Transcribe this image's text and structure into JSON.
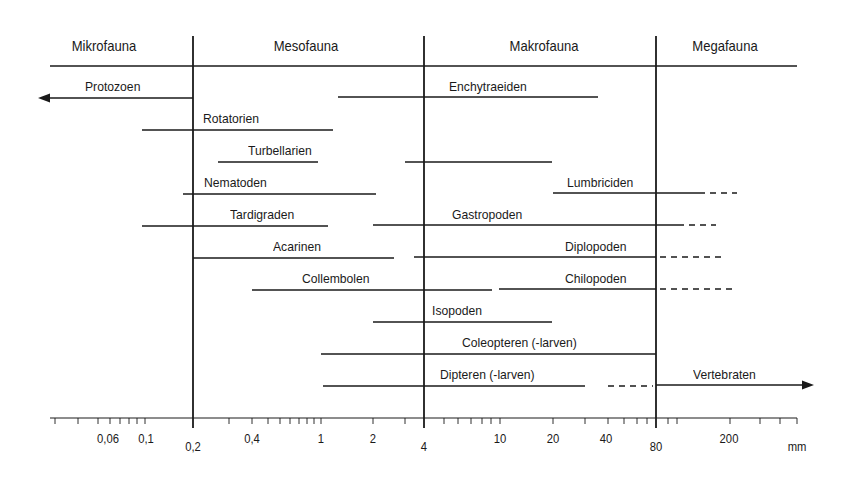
{
  "colors": {
    "line": "#1a1a1a",
    "background": "#ffffff"
  },
  "headers": [
    {
      "label": "Mikrofauna",
      "x_center": 104
    },
    {
      "label": "Mesofauna",
      "x_center": 306
    },
    {
      "label": "Makrofauna",
      "x_center": 544
    },
    {
      "label": "Megafauna",
      "x_center": 725
    }
  ],
  "groups": [
    {
      "label": "Protozoen",
      "label_x": 85,
      "label_y": 79,
      "y": 98,
      "segments": [
        {
          "x1": 50,
          "x2": 193,
          "style": "solid"
        }
      ],
      "arrow_left": true
    },
    {
      "label": "Enchytraeiden",
      "label_x": 449,
      "label_y": 79,
      "y": 97,
      "segments": [
        {
          "x1": 338,
          "x2": 598,
          "style": "solid"
        }
      ]
    },
    {
      "label": "Rotatorien",
      "label_x": 203,
      "label_y": 111,
      "y": 130,
      "segments": [
        {
          "x1": 142,
          "x2": 333,
          "style": "solid"
        }
      ]
    },
    {
      "label": "Turbellarien",
      "label_x": 248,
      "label_y": 143,
      "y": 162,
      "segments": [
        {
          "x1": 218,
          "x2": 318,
          "style": "solid"
        },
        {
          "x1": 405,
          "x2": 552,
          "style": "solid"
        }
      ]
    },
    {
      "label": "Nematoden",
      "label_x": 204,
      "label_y": 175,
      "y": 194,
      "segments": [
        {
          "x1": 183,
          "x2": 376,
          "style": "solid"
        }
      ]
    },
    {
      "label": "Lumbriciden",
      "label_x": 567,
      "label_y": 175,
      "y": 193,
      "segments": [
        {
          "x1": 553,
          "x2": 705,
          "style": "solid"
        },
        {
          "x1": 710,
          "x2": 737,
          "style": "dashed"
        }
      ]
    },
    {
      "label": "Tardigraden",
      "label_x": 230,
      "label_y": 207,
      "y": 226,
      "segments": [
        {
          "x1": 142,
          "x2": 328,
          "style": "solid"
        }
      ]
    },
    {
      "label": "Gastropoden",
      "label_x": 452,
      "label_y": 207,
      "y": 225,
      "segments": [
        {
          "x1": 373,
          "x2": 684,
          "style": "solid"
        },
        {
          "x1": 689,
          "x2": 716,
          "style": "dashed"
        }
      ]
    },
    {
      "label": "Acarinen",
      "label_x": 273,
      "label_y": 239,
      "y": 258,
      "segments": [
        {
          "x1": 193,
          "x2": 394,
          "style": "solid"
        }
      ]
    },
    {
      "label": "Diplopoden",
      "label_x": 565,
      "label_y": 239,
      "y": 257,
      "segments": [
        {
          "x1": 414,
          "x2": 656,
          "style": "solid"
        },
        {
          "x1": 660,
          "x2": 724,
          "style": "dashed"
        }
      ]
    },
    {
      "label": "Collembolen",
      "label_x": 302,
      "label_y": 271,
      "y": 290,
      "segments": [
        {
          "x1": 252,
          "x2": 492,
          "style": "solid"
        }
      ]
    },
    {
      "label": "Chilopoden",
      "label_x": 565,
      "label_y": 271,
      "y": 289,
      "segments": [
        {
          "x1": 499,
          "x2": 656,
          "style": "solid"
        },
        {
          "x1": 660,
          "x2": 732,
          "style": "dashed"
        }
      ]
    },
    {
      "label": "Isopoden",
      "label_x": 432,
      "label_y": 303,
      "y": 322,
      "segments": [
        {
          "x1": 373,
          "x2": 552,
          "style": "solid"
        }
      ]
    },
    {
      "label": "Coleopteren (-larven)",
      "label_x": 462,
      "label_y": 335,
      "y": 354,
      "segments": [
        {
          "x1": 321,
          "x2": 656,
          "style": "solid"
        }
      ]
    },
    {
      "label": "Dipteren (-larven)",
      "label_x": 440,
      "label_y": 367,
      "y": 386,
      "segments": [
        {
          "x1": 323,
          "x2": 585,
          "style": "solid"
        },
        {
          "x1": 608,
          "x2": 653,
          "style": "dashed"
        }
      ]
    },
    {
      "label": "Vertebraten",
      "label_x": 693,
      "label_y": 367,
      "y": 385,
      "segments": [
        {
          "x1": 656,
          "x2": 804,
          "style": "solid"
        }
      ],
      "arrow_right": true
    }
  ],
  "dividers": [
    {
      "value": "0,2",
      "x": 193
    },
    {
      "value": "4",
      "x": 424
    },
    {
      "value": "80",
      "x": 656
    }
  ],
  "axis": {
    "unit": "mm",
    "baseline_y": 418,
    "x_start": 50,
    "x_end": 797,
    "minor_ticks_x": [
      55,
      78,
      98,
      110,
      120,
      129,
      137,
      145,
      229,
      252,
      268,
      280,
      290,
      299,
      307,
      314,
      321,
      373,
      405,
      444,
      458,
      471,
      482,
      491,
      500,
      553,
      585,
      608,
      624,
      637,
      647,
      668,
      677,
      730,
      760,
      780,
      797
    ],
    "tick_labels": [
      {
        "label": "0,06",
        "x": 108,
        "y": 432
      },
      {
        "label": "0,1",
        "x": 146,
        "y": 432
      },
      {
        "label": "0,2",
        "x": 193,
        "y": 440
      },
      {
        "label": "0,4",
        "x": 252,
        "y": 432
      },
      {
        "label": "1",
        "x": 321,
        "y": 432
      },
      {
        "label": "2",
        "x": 373,
        "y": 432
      },
      {
        "label": "4",
        "x": 424,
        "y": 440
      },
      {
        "label": "10",
        "x": 500,
        "y": 432
      },
      {
        "label": "20",
        "x": 553,
        "y": 432
      },
      {
        "label": "40",
        "x": 606,
        "y": 432
      },
      {
        "label": "80",
        "x": 656,
        "y": 440
      },
      {
        "label": "200",
        "x": 729,
        "y": 432
      },
      {
        "label": "mm",
        "x": 797,
        "y": 440
      }
    ]
  }
}
